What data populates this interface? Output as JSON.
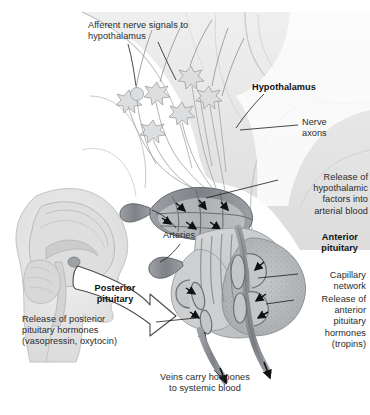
{
  "figure": {
    "palette": {
      "background": "#ffffff",
      "brain_tissue": "#e9e9e9",
      "brain_tissue_dark": "#d2d2d2",
      "vessel": "#8e9196",
      "vessel_dark": "#6f7378",
      "gland": "#c9cbcd",
      "anterior_gland": "#b9bcbe",
      "text": "#2b2b2b",
      "leader_line": "#1a1a1a"
    }
  },
  "labels": {
    "afferent": "Afferent nerve signals to\nhypothalamus",
    "hypothalamus": "Hypothalamus",
    "nerve_axons": "Nerve\naxons",
    "release_hypothalamic": "Release of\nhypothalamic\nfactors into\narterial blood",
    "arteries": "Arteries",
    "anterior_pituitary": "Anterior\npituitary",
    "capillary_network": "Capillary\nnetwork",
    "release_anterior": "Release of\nanterior\npituitary\nhormones\n(tropins)",
    "posterior_pituitary": "Posterior\npituitary",
    "release_posterior": "Release of posterior\npituitary hormones\n(vasopressin, oxytocin)",
    "veins": "Veins carry hormones\nto systemic blood"
  },
  "structures": {
    "inset": "head-profile-sagittal-brain",
    "arrow": "magnification-arrow",
    "neurons": "hypothalamic-neuron-cell-bodies",
    "primary_plexus": "primary-capillary-plexus",
    "portal_vessels": "hypophyseal-portal-vessels",
    "secondary_plexus": "secondary-capillary-plexus",
    "draining_veins": "draining-veins"
  }
}
